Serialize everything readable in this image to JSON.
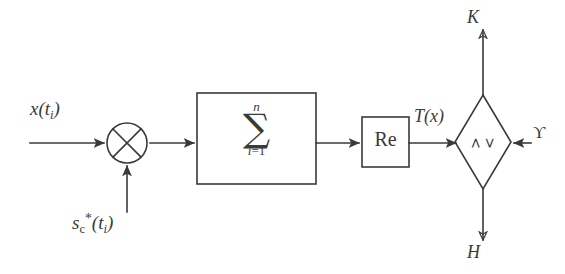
{
  "diagram": {
    "background_color": "#ffffff",
    "stroke_color": "#3a3a3a",
    "nodes": {
      "multiplier": {
        "name": "multiplier",
        "symbol": "cross-in-circle",
        "cx": 127,
        "cy": 143,
        "r": 20
      },
      "summation": {
        "name": "summation-block",
        "sigma": "∑",
        "upper_limit": "n",
        "lower_limit_var": "i",
        "lower_limit_eq": "=1",
        "x": 197,
        "y": 93,
        "w": 119,
        "h": 91
      },
      "real_part": {
        "name": "real-part-block",
        "label": "Re",
        "x": 362,
        "y": 117,
        "w": 47,
        "h": 50
      },
      "comparator": {
        "name": "threshold-comparator",
        "op_top": ">",
        "op_bottom": "<",
        "cx": 483,
        "cy": 142,
        "rx": 28,
        "ry": 47
      }
    },
    "labels": {
      "input_signal": {
        "base": "x",
        "arg_open": "(",
        "t": "t",
        "t_sub": "i",
        "arg_close": ")"
      },
      "reference_signal": {
        "base": "s",
        "sub": "c",
        "sup": "*",
        "arg_open": "(",
        "t": "t",
        "t_sub": "i",
        "arg_close": ")"
      },
      "statistic": {
        "base": "T",
        "arg_open": "(",
        "arg": "x",
        "arg_close": ")"
      },
      "hypothesis_k": "K",
      "hypothesis_h": "H",
      "threshold": "ϒ"
    },
    "edges": [
      {
        "name": "input-to-multiplier",
        "from": "x(t_i)",
        "to": "multiplier",
        "direction": "right"
      },
      {
        "name": "reference-to-multiplier",
        "from": "s_c*(t_i)",
        "to": "multiplier",
        "direction": "up"
      },
      {
        "name": "multiplier-to-summation",
        "from": "multiplier",
        "to": "summation",
        "direction": "right"
      },
      {
        "name": "summation-to-real-part",
        "from": "summation",
        "to": "real-part",
        "direction": "right"
      },
      {
        "name": "real-part-to-comparator",
        "from": "real-part",
        "to": "comparator",
        "direction": "right"
      },
      {
        "name": "threshold-to-comparator",
        "from": "threshold",
        "to": "comparator",
        "direction": "left"
      },
      {
        "name": "comparator-to-k",
        "from": "comparator",
        "to": "K",
        "direction": "up"
      },
      {
        "name": "comparator-to-h",
        "from": "comparator",
        "to": "H",
        "direction": "down"
      }
    ]
  }
}
